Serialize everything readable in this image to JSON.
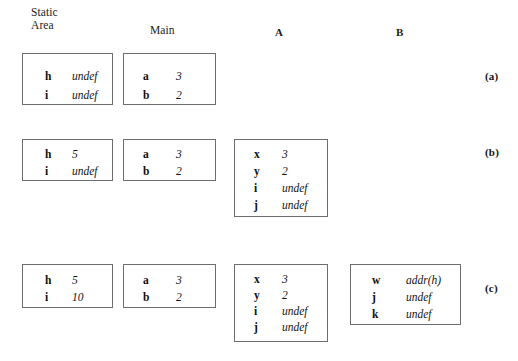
{
  "headers": {
    "static_area": "Static\nArea",
    "main": "Main",
    "a": "A",
    "b": "B"
  },
  "row_labels": {
    "a": "(a)",
    "b": "(b)",
    "c": "(c)"
  },
  "frames": {
    "a_static": {
      "title": "Static Area",
      "rows": [
        {
          "name": "h",
          "value": "undef"
        },
        {
          "name": "i",
          "value": "undef"
        }
      ]
    },
    "a_main": {
      "title": "Main",
      "rows": [
        {
          "name": "a",
          "value": "3"
        },
        {
          "name": "b",
          "value": "2"
        }
      ]
    },
    "b_static": {
      "title": "Static Area",
      "rows": [
        {
          "name": "h",
          "value": "5"
        },
        {
          "name": "i",
          "value": "undef"
        }
      ]
    },
    "b_main": {
      "title": "Main",
      "rows": [
        {
          "name": "a",
          "value": "3"
        },
        {
          "name": "b",
          "value": "2"
        }
      ]
    },
    "b_a": {
      "title": "A",
      "rows": [
        {
          "name": "x",
          "value": "3"
        },
        {
          "name": "y",
          "value": "2"
        },
        {
          "name": "i",
          "value": "undef"
        },
        {
          "name": "j",
          "value": "undef"
        }
      ]
    },
    "c_static": {
      "title": "Static Area",
      "rows": [
        {
          "name": "h",
          "value": "5"
        },
        {
          "name": "i",
          "value": "10"
        }
      ]
    },
    "c_main": {
      "title": "Main",
      "rows": [
        {
          "name": "a",
          "value": "3"
        },
        {
          "name": "b",
          "value": "2"
        }
      ]
    },
    "c_a": {
      "title": "A",
      "rows": [
        {
          "name": "x",
          "value": "3"
        },
        {
          "name": "y",
          "value": "2"
        },
        {
          "name": "i",
          "value": "undef"
        },
        {
          "name": "j",
          "value": "undef"
        }
      ]
    },
    "c_b": {
      "title": "B",
      "rows": [
        {
          "name": "w",
          "value": "addr(h)"
        },
        {
          "name": "j",
          "value": "undef"
        },
        {
          "name": "k",
          "value": "undef"
        }
      ]
    }
  },
  "colors": {
    "background": "#ffffff",
    "frame_border": "#6d6d6d",
    "text": "#141414"
  }
}
